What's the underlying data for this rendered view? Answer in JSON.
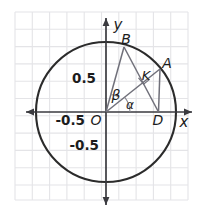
{
  "figure": {
    "type": "unit-circle-geometry-diagram",
    "background": "#ffffff",
    "grid_color": "#e3e3e6",
    "axis_color": "#3a3a3f",
    "circle_color": "#2b2b2b",
    "chord_color": "#6f6f78",
    "label_color": "#1c1c1c"
  },
  "axes": {
    "x_label": "x",
    "y_label": "y",
    "origin_label": "O",
    "x_ticks": [
      {
        "label": "-0.5",
        "value": -0.5
      }
    ],
    "y_ticks": [
      {
        "label": "0.5",
        "value": 0.5
      },
      {
        "label": "-0.5",
        "value": -0.5
      }
    ]
  },
  "points": [
    {
      "name": "O",
      "label": "O",
      "x": 0.0,
      "y": 0.0
    },
    {
      "name": "B",
      "label": "B",
      "x": 0.26,
      "y": 0.93
    },
    {
      "name": "A",
      "label": "A",
      "x": 0.78,
      "y": 0.62
    },
    {
      "name": "K",
      "label": "K",
      "x": 0.55,
      "y": 0.45
    },
    {
      "name": "D",
      "label": "D",
      "x": 0.75,
      "y": 0.0
    }
  ],
  "angles": [
    {
      "name": "alpha",
      "label": "α",
      "from": "x-axis",
      "to": "OA"
    },
    {
      "name": "beta",
      "label": "β",
      "from": "OA",
      "to": "OB"
    }
  ],
  "segments": [
    {
      "name": "OB",
      "from": "O",
      "to": "B"
    },
    {
      "name": "OA",
      "from": "O",
      "to": "A"
    },
    {
      "name": "BD",
      "from": "B",
      "to": "D"
    },
    {
      "name": "AD",
      "from": "A",
      "to": "D"
    }
  ],
  "circle": {
    "name": "unit-circle",
    "center": "O",
    "radius": 1.0
  }
}
